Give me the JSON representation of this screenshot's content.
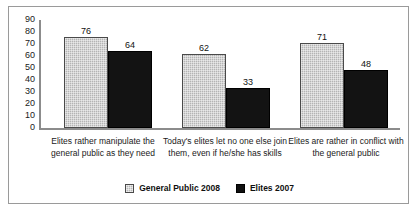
{
  "chart_data": {
    "type": "bar",
    "title": "",
    "xlabel": "",
    "ylabel": "",
    "ylim": [
      0,
      90
    ],
    "y_ticks": [
      90,
      80,
      70,
      60,
      50,
      40,
      30,
      20,
      10,
      0
    ],
    "grid": false,
    "legend_position": "bottom-center",
    "categories": [
      "Elites rather manipulate the general public as they need",
      "Today's elites let no one else join them, even if he/she has skills",
      "Elites are rather in conflict with the general public"
    ],
    "series": [
      {
        "name": "General Public 2008",
        "color": "#b4b4b4",
        "values": [
          76,
          62,
          71
        ]
      },
      {
        "name": "Elites 2007",
        "color": "#131313",
        "values": [
          64,
          33,
          48
        ]
      }
    ]
  },
  "legend": {
    "items": [
      {
        "label": "General Public 2008",
        "swatch": "gray-hatched-swatch"
      },
      {
        "label": "Elites 2007",
        "swatch": "black-swatch"
      }
    ]
  }
}
